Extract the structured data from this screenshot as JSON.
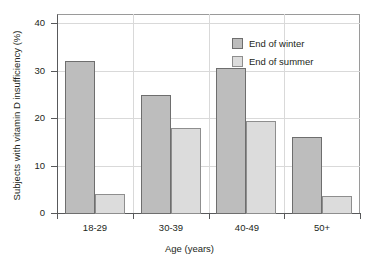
{
  "chart_data": {
    "type": "bar",
    "title": "",
    "xlabel": "Age (years)",
    "ylabel": "Subjects with vitamin D insufficiency (%)",
    "categories": [
      "18-29",
      "30-39",
      "40-49",
      "50+"
    ],
    "ylim": [
      0,
      42
    ],
    "yticks": [
      0,
      10,
      20,
      30,
      40
    ],
    "ytick_labels": [
      "0",
      "10",
      "20",
      "30",
      "40"
    ],
    "grid": true,
    "legend_position": "top-right",
    "series": [
      {
        "name": "End of winter",
        "color": "#bdbdbd",
        "values": [
          32,
          25,
          30.5,
          16
        ]
      },
      {
        "name": "End of summer",
        "color": "#dcdcdc",
        "values": [
          4,
          18,
          19.5,
          3.5
        ]
      }
    ]
  },
  "axes": {
    "y_title": "Subjects with vitamin D insufficiency (%)",
    "x_title": "Age (years)",
    "y_tick_0": "0",
    "y_tick_1": "10",
    "y_tick_2": "20",
    "y_tick_3": "30",
    "y_tick_4": "40",
    "x_tick_0": "18-29",
    "x_tick_1": "30-39",
    "x_tick_2": "40-49",
    "x_tick_3": "50+"
  },
  "legend": {
    "items": [
      {
        "label": "End of winter",
        "color": "#bdbdbd"
      },
      {
        "label": "End of summer",
        "color": "#dcdcdc"
      }
    ]
  }
}
